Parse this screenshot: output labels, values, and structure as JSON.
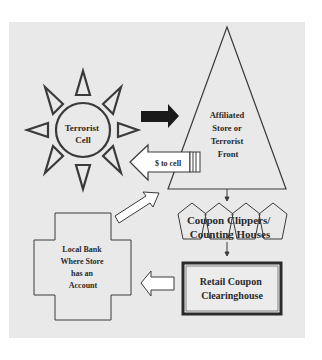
{
  "diagram": {
    "colors": {
      "page_background": "#ffffff",
      "panel_background": "#e9e9e9",
      "stroke": "#3a3a3a",
      "solid_arrow": "#1a1a1a",
      "text": "#2a2a2a"
    },
    "nodes": {
      "terrorist_cell": {
        "shape": "sun",
        "lines": [
          "Terrorist",
          "Cell"
        ]
      },
      "affiliated_store": {
        "shape": "triangle",
        "lines": [
          "Affiliated",
          "Store or",
          "Terrorist",
          "Front"
        ]
      },
      "coupon_clippers": {
        "shape": "pentagons",
        "count": 4,
        "lines": [
          "Coupon Clippers/",
          "Counting Houses"
        ]
      },
      "clearinghouse": {
        "shape": "double-border-rectangle",
        "lines": [
          "Retail Coupon",
          "Clearinghouse"
        ]
      },
      "local_bank": {
        "shape": "cross",
        "lines": [
          "Local Bank",
          "Where Store",
          "has an",
          "Account"
        ]
      }
    },
    "edges": [
      {
        "from": "terrorist_cell",
        "to": "affiliated_store",
        "style": "solid-black-arrow",
        "label": ""
      },
      {
        "from": "affiliated_store",
        "to": "terrorist_cell",
        "style": "outline-striped-arrow",
        "label": "$ to cell"
      },
      {
        "from": "affiliated_store",
        "to": "coupon_clippers",
        "style": "thin-arrow",
        "label": ""
      },
      {
        "from": "coupon_clippers",
        "to": "clearinghouse",
        "style": "thin-arrow",
        "label": ""
      },
      {
        "from": "clearinghouse",
        "to": "local_bank",
        "style": "outline-arrow",
        "label": ""
      },
      {
        "from": "local_bank",
        "to": "affiliated_store",
        "style": "outline-arrow",
        "label": ""
      }
    ]
  }
}
